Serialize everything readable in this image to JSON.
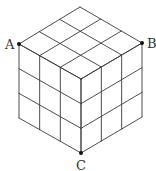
{
  "diagram": {
    "type": "isometric-cube-grid",
    "divisions": 3,
    "colors": {
      "line": "#3a3a3a",
      "point": "#111111",
      "label": "#333333",
      "background": "#ffffff"
    },
    "vertices": {
      "top": [
        80,
        7
      ],
      "left": [
        19,
        44
      ],
      "right": [
        142,
        43
      ],
      "center": [
        81,
        79
      ],
      "bottom_left": [
        19,
        118
      ],
      "bottom_right": [
        142,
        117
      ],
      "bottom": [
        81,
        153
      ]
    },
    "points": [
      {
        "id": "A",
        "label": "A",
        "at": "left",
        "label_dx": -14,
        "label_dy": 5
      },
      {
        "id": "B",
        "label": "B",
        "at": "right",
        "label_dx": 5,
        "label_dy": 5
      },
      {
        "id": "C",
        "label": "C",
        "at": "bottom",
        "label_dx": -5,
        "label_dy": 17
      }
    ]
  }
}
